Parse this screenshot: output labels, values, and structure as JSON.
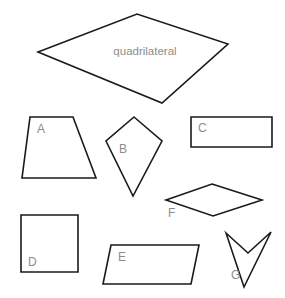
{
  "page": {
    "background_color": "#ffffff",
    "stroke_color": "#1a1a1a",
    "label_color": "#8c8c8c",
    "width": 285,
    "height": 298
  },
  "main_shape": {
    "name": "quadrilateral",
    "label": "quadrilateral",
    "label_x": 145,
    "label_y": 55,
    "points": "38,52 137,14 228,44 162,103",
    "vertices": [
      {
        "x": 38,
        "y": 52
      },
      {
        "x": 137,
        "y": 14
      },
      {
        "x": 228,
        "y": 44
      },
      {
        "x": 162,
        "y": 103
      }
    ]
  },
  "shapes": [
    {
      "id": "A",
      "label": "A",
      "kind": "trapezoid",
      "label_x": 37,
      "label_y": 133,
      "points": "30,117 73,117 96,178 22,178",
      "vertices": [
        {
          "x": 30,
          "y": 117
        },
        {
          "x": 73,
          "y": 117
        },
        {
          "x": 96,
          "y": 178
        },
        {
          "x": 22,
          "y": 178
        }
      ]
    },
    {
      "id": "B",
      "label": "B",
      "kind": "kite",
      "label_x": 119,
      "label_y": 153,
      "points": "134,117 162,141 133,196 106,141",
      "vertices": [
        {
          "x": 134,
          "y": 117
        },
        {
          "x": 162,
          "y": 141
        },
        {
          "x": 133,
          "y": 196
        },
        {
          "x": 106,
          "y": 141
        }
      ]
    },
    {
      "id": "C",
      "label": "C",
      "kind": "rectangle",
      "label_x": 198,
      "label_y": 132,
      "points": "191,117 272,117 272,147 191,147",
      "vertices": [
        {
          "x": 191,
          "y": 117
        },
        {
          "x": 272,
          "y": 117
        },
        {
          "x": 272,
          "y": 147
        },
        {
          "x": 191,
          "y": 147
        }
      ]
    },
    {
      "id": "D",
      "label": "D",
      "kind": "square",
      "label_x": 28,
      "label_y": 266,
      "points": "21,215 78,215 78,272 21,272",
      "vertices": [
        {
          "x": 21,
          "y": 215
        },
        {
          "x": 78,
          "y": 215
        },
        {
          "x": 78,
          "y": 272
        },
        {
          "x": 21,
          "y": 272
        }
      ]
    },
    {
      "id": "E",
      "label": "E",
      "kind": "parallelogram",
      "label_x": 118,
      "label_y": 261,
      "points": "111,245 199,245 191,284 103,284",
      "vertices": [
        {
          "x": 111,
          "y": 245
        },
        {
          "x": 199,
          "y": 245
        },
        {
          "x": 191,
          "y": 284
        },
        {
          "x": 103,
          "y": 284
        }
      ]
    },
    {
      "id": "F",
      "label": "F",
      "kind": "rhombus",
      "label_x": 168,
      "label_y": 217,
      "points": "212,184 262,200 213,216 166,200",
      "vertices": [
        {
          "x": 212,
          "y": 184
        },
        {
          "x": 262,
          "y": 200
        },
        {
          "x": 213,
          "y": 216
        },
        {
          "x": 166,
          "y": 200
        }
      ]
    },
    {
      "id": "G",
      "label": "G",
      "kind": "dart",
      "label_x": 231,
      "label_y": 279,
      "points": "226,233 248,253 271,232 244,287",
      "vertices": [
        {
          "x": 226,
          "y": 233
        },
        {
          "x": 248,
          "y": 253
        },
        {
          "x": 271,
          "y": 232
        },
        {
          "x": 244,
          "y": 287
        }
      ]
    }
  ]
}
